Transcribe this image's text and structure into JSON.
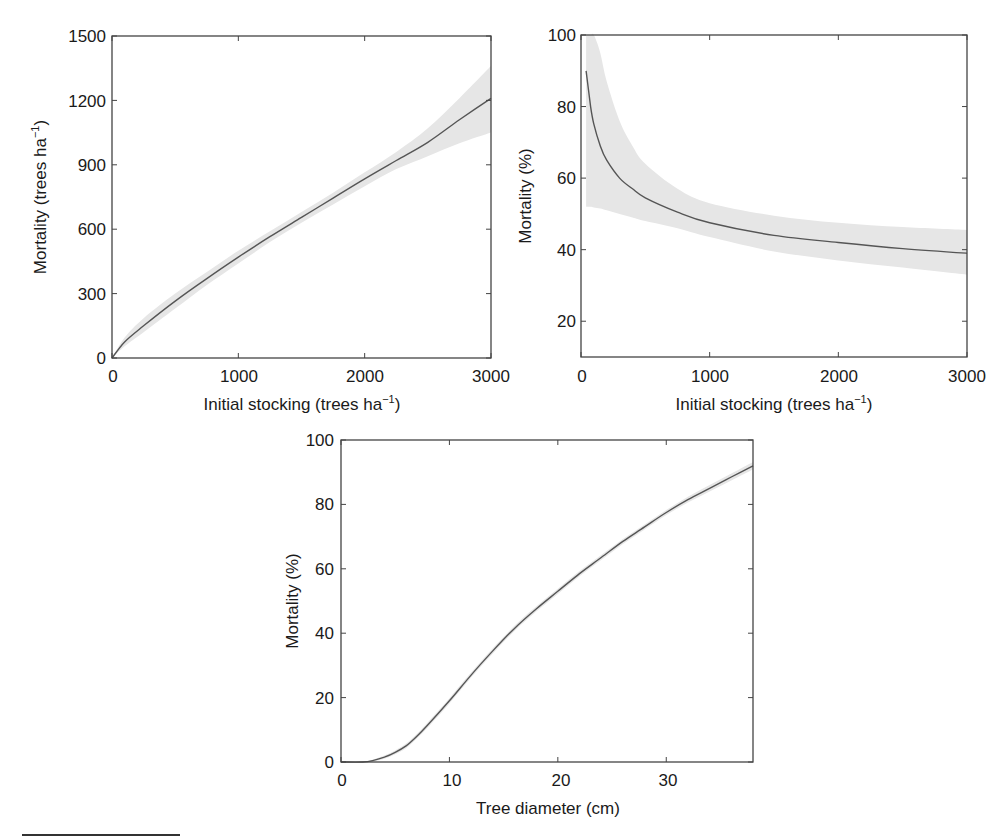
{
  "chart_data": [
    {
      "id": "stocking-vs-mortality-trees",
      "type": "line",
      "title": "",
      "xlabel": "Initial stocking (trees ha⁻¹)",
      "ylabel": "Mortality (trees ha⁻¹)",
      "xlim": [
        0,
        3000
      ],
      "ylim": [
        0,
        1500
      ],
      "xticks": [
        0,
        1000,
        2000,
        3000
      ],
      "yticks": [
        0,
        300,
        600,
        900,
        1200,
        1500
      ],
      "grid": false,
      "legend": null,
      "x": [
        0,
        100,
        250,
        500,
        750,
        1000,
        1250,
        1500,
        1750,
        2000,
        2250,
        2500,
        2750,
        3000
      ],
      "series": [
        {
          "name": "fit",
          "values": [
            0,
            75,
            150,
            265,
            370,
            470,
            565,
            655,
            745,
            835,
            920,
            1005,
            1110,
            1210
          ]
        },
        {
          "name": "ci_upper",
          "values": [
            0,
            95,
            185,
            300,
            400,
            500,
            590,
            680,
            770,
            865,
            960,
            1070,
            1210,
            1360
          ]
        },
        {
          "name": "ci_lower",
          "values": [
            0,
            55,
            120,
            230,
            340,
            440,
            540,
            630,
            715,
            800,
            880,
            940,
            1000,
            1050
          ]
        }
      ]
    },
    {
      "id": "stocking-vs-mortality-percent",
      "type": "line",
      "title": "",
      "xlabel": "Initial stocking (trees ha⁻¹)",
      "ylabel": "Mortality (%)",
      "xlim": [
        0,
        3000
      ],
      "ylim": [
        10,
        100
      ],
      "xticks": [
        0,
        1000,
        2000,
        3000
      ],
      "yticks": [
        20,
        40,
        60,
        80,
        100
      ],
      "grid": false,
      "legend": null,
      "x": [
        40,
        75,
        100,
        150,
        200,
        300,
        400,
        500,
        750,
        1000,
        1500,
        2000,
        2500,
        3000
      ],
      "series": [
        {
          "name": "fit",
          "values": [
            90,
            80,
            75,
            69,
            65,
            60,
            57,
            54.5,
            50.5,
            47.5,
            44,
            42,
            40.3,
            39
          ]
        },
        {
          "name": "ci_upper",
          "values": [
            100,
            100,
            100,
            95,
            87,
            76,
            69,
            64,
            57,
            53,
            49.5,
            47.5,
            46.3,
            45.5
          ]
        },
        {
          "name": "ci_lower",
          "values": [
            52,
            52,
            51.8,
            51.5,
            51,
            50,
            49,
            48,
            46,
            43.5,
            39.5,
            37,
            35,
            33
          ]
        }
      ]
    },
    {
      "id": "diameter-vs-mortality",
      "type": "line",
      "title": "",
      "xlabel": "Tree diameter (cm)",
      "ylabel": "Mortality (%)",
      "xlim": [
        0,
        38
      ],
      "ylim": [
        0,
        100
      ],
      "xticks": [
        0,
        10,
        20,
        30
      ],
      "yticks": [
        0,
        20,
        40,
        60,
        80,
        100
      ],
      "grid": false,
      "legend": null,
      "x": [
        0,
        2,
        3,
        4,
        5,
        6,
        7,
        8,
        10,
        12,
        14,
        16,
        18,
        20,
        22,
        24,
        26,
        28,
        30,
        32,
        34,
        36,
        38
      ],
      "series": [
        {
          "name": "fit",
          "values": [
            0,
            0,
            0.5,
            1.5,
            3,
            5,
            8,
            11.5,
            19,
            27,
            34.5,
            41.5,
            47.5,
            53,
            58.5,
            63.5,
            68.5,
            73,
            77.5,
            81.5,
            85,
            88.5,
            92
          ]
        },
        {
          "name": "ci_upper",
          "values": [
            0,
            0,
            0.8,
            2,
            3.6,
            5.7,
            8.7,
            12.3,
            19.8,
            27.8,
            35.3,
            42.3,
            48.3,
            53.8,
            59.3,
            64.3,
            69.3,
            73.8,
            78.3,
            82.4,
            86,
            89.6,
            93.2
          ]
        },
        {
          "name": "ci_lower",
          "values": [
            0,
            0,
            0.2,
            1,
            2.4,
            4.3,
            7.3,
            10.7,
            18.2,
            26.2,
            33.7,
            40.7,
            46.7,
            52.2,
            57.7,
            62.7,
            67.7,
            72.2,
            76.7,
            80.6,
            84,
            87.4,
            90.8
          ]
        }
      ]
    }
  ],
  "panels": {
    "top_left": {
      "ylabel_text": "Mortality (trees ha",
      "ylabel_sup": "−1",
      "ylabel_close": ")",
      "xlabel_text": "Initial stocking (trees ha",
      "xlabel_sup": "−1",
      "xlabel_close": ")",
      "xtick_labels": [
        "0",
        "1000",
        "2000",
        "3000"
      ],
      "ytick_labels": [
        "0",
        "300",
        "600",
        "900",
        "1200",
        "1500"
      ]
    },
    "top_right": {
      "ylabel_text": "Mortality (%)",
      "xlabel_text": "Initial stocking (trees ha",
      "xlabel_sup": "−1",
      "xlabel_close": ")",
      "xtick_labels": [
        "0",
        "1000",
        "2000",
        "3000"
      ],
      "ytick_labels": [
        "20",
        "40",
        "60",
        "80",
        "100"
      ]
    },
    "bottom": {
      "ylabel_text": "Mortality (%)",
      "xlabel_text": "Tree diameter (cm)",
      "xtick_labels": [
        "0",
        "10",
        "20",
        "30"
      ],
      "ytick_labels": [
        "0",
        "20",
        "40",
        "60",
        "80",
        "100"
      ]
    }
  },
  "colors": {
    "curve": "#555555",
    "band": "#e6e6e6",
    "frame": "#444444",
    "text": "#1a1a1a"
  }
}
